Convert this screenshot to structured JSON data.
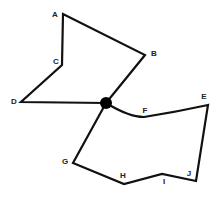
{
  "diagram": {
    "hub": {
      "x": 106,
      "y": 103,
      "r": 6,
      "color": "#000000"
    },
    "nodes": {
      "A": {
        "label": "A",
        "x": 63,
        "y": 14,
        "lx": 55,
        "ly": 15
      },
      "B": {
        "label": "B",
        "x": 145,
        "y": 55,
        "lx": 154,
        "ly": 54
      },
      "C": {
        "label": "C",
        "x": 62,
        "y": 65,
        "lx": 56,
        "ly": 62
      },
      "D": {
        "label": "D",
        "x": 21,
        "y": 102,
        "lx": 14,
        "ly": 102
      },
      "E": {
        "label": "E",
        "x": 208,
        "y": 105,
        "lx": 204,
        "ly": 97
      },
      "F": {
        "label": "F",
        "x": 144,
        "y": 117,
        "lx": 145,
        "ly": 111
      },
      "G": {
        "label": "G",
        "x": 73,
        "y": 163,
        "lx": 65,
        "ly": 162
      },
      "H": {
        "label": "H",
        "x": 124,
        "y": 184,
        "lx": 123,
        "ly": 176
      },
      "I": {
        "label": "I",
        "x": 162,
        "y": 174,
        "lx": 164,
        "ly": 182
      },
      "J": {
        "label": "J",
        "x": 196,
        "y": 181,
        "lx": 189,
        "ly": 174
      }
    },
    "upper_loop": [
      "hub",
      "B",
      "A",
      "C",
      "D",
      "hub"
    ],
    "lower_loop": [
      "hub",
      "F",
      "E",
      "J",
      "I",
      "H",
      "G",
      "hub"
    ]
  }
}
